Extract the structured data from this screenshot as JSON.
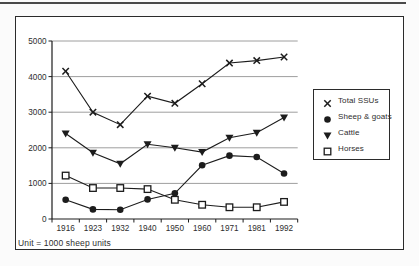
{
  "figure": {
    "unit_note": "Unit = 1000 sheep units"
  },
  "colors": {
    "line": "#1c1c1c",
    "grid": "#9e9e9e",
    "text": "#2e2e2e",
    "frame": "#2b2b2b",
    "background": "#ffffff",
    "page_background": "#fbfbfb"
  },
  "chart_data": {
    "type": "line",
    "title": "",
    "xlabel": "",
    "ylabel": "",
    "unit_note": "Unit = 1000 sheep units",
    "categories": [
      "1916",
      "1923",
      "1932",
      "1940",
      "1950",
      "1960",
      "1971",
      "1981",
      "1992"
    ],
    "yticks": [
      0,
      1000,
      2000,
      3000,
      4000,
      5000
    ],
    "ylim": [
      0,
      5000
    ],
    "grid": "horizontal",
    "legend_position": "right-box",
    "series": [
      {
        "name": "Total SSUs",
        "marker": "x",
        "values": [
          4150,
          3000,
          2650,
          3450,
          3250,
          3800,
          4380,
          4450,
          4550
        ]
      },
      {
        "name": "Sheep & goats",
        "marker": "filled-circle",
        "values": [
          540,
          270,
          260,
          550,
          720,
          1510,
          1780,
          1740,
          1280
        ]
      },
      {
        "name": "Cattle",
        "marker": "filled-triangle-down",
        "values": [
          2400,
          1860,
          1550,
          2100,
          2000,
          1880,
          2280,
          2420,
          2850
        ]
      },
      {
        "name": "Horses",
        "marker": "open-square",
        "values": [
          1220,
          870,
          870,
          840,
          540,
          400,
          330,
          330,
          480
        ]
      }
    ]
  }
}
